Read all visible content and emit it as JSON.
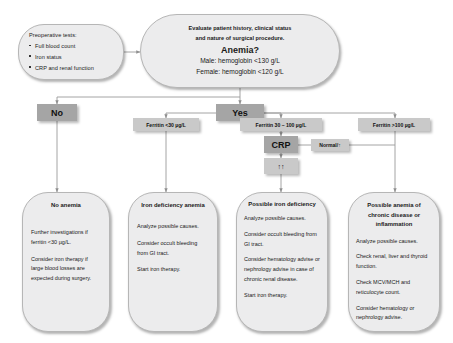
{
  "diagram": {
    "type": "flowchart",
    "colors": {
      "node_fill": "#ececed",
      "node_border": "#b6b6b6",
      "chip_dark": "#a5a5a5",
      "chip_light": "#c9c9c9",
      "line": "#9a9a9a",
      "background": "#ffffff"
    }
  },
  "preop": {
    "title": "Preoperative tests:",
    "items": [
      "Full blood count",
      "Iron status",
      "CRP and renal function"
    ]
  },
  "evaluate": {
    "line1": "Evaluate patient history, clinical status",
    "line2": "and nature of surgical procedure.",
    "question": "Anemia?",
    "male": "Male: hemoglobin <130 g/L",
    "female": "Female: hemoglobin <120 g/L"
  },
  "decision": {
    "no": "No",
    "yes": "Yes"
  },
  "ferritin": {
    "low": "Ferritin <30 µg/L",
    "mid": "Ferritin 30 – 100 µg/L",
    "high": "Ferritin >100 µg/L"
  },
  "crp": {
    "label": "CRP",
    "normal_branch": "Normal/↑",
    "high_branch": "↑↑"
  },
  "outcomes": [
    {
      "id": "no-anemia",
      "title": "No anemia",
      "paragraphs": [
        "Further investigations if ferritin <30 µg/L.",
        "Consider iron therapy if large blood losses are expected during surgery."
      ]
    },
    {
      "id": "iron-deficiency-anemia",
      "title": "Iron deficiency anemia",
      "paragraphs": [
        "Analyze possible causes.",
        "Consider occult bleeding from GI tract.",
        "Start iron therapy."
      ]
    },
    {
      "id": "possible-iron-deficiency",
      "title": "Possible iron deficiency",
      "paragraphs": [
        "Analyze possible causes.",
        "Consider occult bleeding from GI tract.",
        "Consider hematology advise or nephrology advise in case of chronic renal disease.",
        "Start iron therapy."
      ]
    },
    {
      "id": "possible-anemia-chronic-disease",
      "title": "Possible anemia of chronic disease or inflammation",
      "paragraphs": [
        "Analyze possible causes.",
        "Check renal, liver and thyroid function.",
        "Check MCV/MCH and reticulocyte count.",
        "Consider hematology or nephrology advise."
      ]
    }
  ]
}
